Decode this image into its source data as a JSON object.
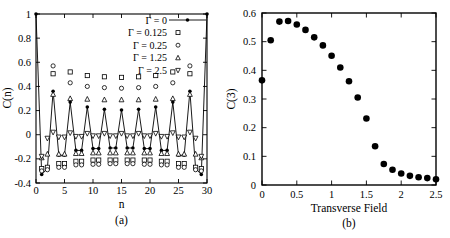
{
  "figure": {
    "background": "#ffffff",
    "ink": "#000000"
  },
  "chart_data": [
    {
      "type": "scatter",
      "panel_label": "(a)",
      "xlabel": "n",
      "ylabel": "C(n)",
      "xlim": [
        0,
        30
      ],
      "ylim": [
        -0.4,
        1
      ],
      "grid": false,
      "xticks": [
        0,
        5,
        10,
        15,
        20,
        25,
        30
      ],
      "xtick_labels": [
        "0",
        "5",
        "10",
        "15",
        "20",
        "25",
        "30"
      ],
      "yticks": [
        -0.4,
        -0.2,
        0,
        0.2,
        0.4,
        0.6,
        0.8,
        1
      ],
      "ytick_labels": [
        "-0.4",
        "-0.2",
        "0",
        "0.2",
        "0.4",
        "0.6",
        "0.8",
        "1"
      ],
      "legend_position": "top-right-inside",
      "series": [
        {
          "name": "Γ = 0",
          "marker": "filled-circle",
          "line": true,
          "x": [
            0,
            1,
            2,
            3,
            4,
            5,
            6,
            7,
            8,
            9,
            10,
            11,
            12,
            13,
            14,
            15,
            16,
            17,
            18,
            19,
            20,
            21,
            22,
            23,
            24,
            25,
            26,
            27,
            28,
            29,
            30
          ],
          "y": [
            1.0,
            -0.33,
            -0.28,
            0.36,
            -0.17,
            -0.17,
            0.27,
            -0.13,
            -0.13,
            0.23,
            -0.115,
            -0.115,
            0.21,
            -0.11,
            -0.11,
            0.205,
            -0.11,
            -0.11,
            0.21,
            -0.115,
            -0.115,
            0.23,
            -0.13,
            -0.13,
            0.27,
            -0.17,
            -0.17,
            0.36,
            -0.28,
            -0.33,
            1.0
          ]
        },
        {
          "name": "Γ = 0.125",
          "marker": "open-square",
          "line": false,
          "x": [
            1,
            2,
            3,
            4,
            5,
            6,
            7,
            8,
            9,
            10,
            11,
            12,
            13,
            14,
            15,
            16,
            17,
            18,
            19,
            20,
            21,
            22,
            23,
            24,
            25,
            26,
            27,
            28,
            29
          ],
          "y": [
            -0.28,
            -0.27,
            0.505,
            -0.24,
            -0.24,
            0.52,
            -0.22,
            -0.22,
            0.49,
            -0.21,
            -0.21,
            0.48,
            -0.21,
            -0.21,
            0.475,
            -0.21,
            -0.21,
            0.48,
            -0.21,
            -0.21,
            0.49,
            -0.22,
            -0.22,
            0.52,
            -0.24,
            -0.24,
            0.505,
            -0.27,
            -0.28
          ]
        },
        {
          "name": "Γ = 0.25",
          "marker": "open-circle",
          "line": false,
          "x": [
            1,
            2,
            3,
            4,
            5,
            6,
            7,
            8,
            9,
            10,
            11,
            12,
            13,
            14,
            15,
            16,
            17,
            18,
            19,
            20,
            21,
            22,
            23,
            24,
            25,
            26,
            27,
            28,
            29
          ],
          "y": [
            -0.3,
            -0.29,
            0.57,
            -0.27,
            -0.27,
            0.43,
            -0.25,
            -0.25,
            0.4,
            -0.245,
            -0.245,
            0.39,
            -0.24,
            -0.24,
            0.385,
            -0.24,
            -0.24,
            0.39,
            -0.245,
            -0.245,
            0.4,
            -0.25,
            -0.25,
            0.43,
            -0.27,
            -0.27,
            0.57,
            -0.29,
            -0.3
          ]
        },
        {
          "name": "Γ = 1.25",
          "marker": "open-triangle-up",
          "line": false,
          "x": [
            1,
            2,
            3,
            4,
            5,
            6,
            7,
            8,
            9,
            10,
            11,
            12,
            13,
            14,
            15,
            16,
            17,
            18,
            19,
            20,
            21,
            22,
            23,
            24,
            25,
            26,
            27,
            28,
            29
          ],
          "y": [
            -0.19,
            -0.16,
            0.335,
            -0.16,
            -0.16,
            0.3,
            -0.155,
            -0.155,
            0.295,
            -0.15,
            -0.15,
            0.29,
            -0.15,
            -0.15,
            0.29,
            -0.15,
            -0.15,
            0.29,
            -0.15,
            -0.15,
            0.295,
            -0.155,
            -0.155,
            0.3,
            -0.16,
            -0.16,
            0.335,
            -0.16,
            -0.19
          ]
        },
        {
          "name": "Γ = 2.5",
          "marker": "open-triangle-down",
          "line": false,
          "x": [
            1,
            2,
            3,
            4,
            5,
            6,
            7,
            8,
            9,
            10,
            11,
            12,
            13,
            14,
            15,
            16,
            17,
            18,
            19,
            20,
            21,
            22,
            23,
            24,
            25,
            26,
            27,
            28,
            29
          ],
          "y": [
            -0.18,
            -0.03,
            0.02,
            -0.02,
            -0.02,
            0.015,
            -0.015,
            -0.015,
            0.01,
            -0.01,
            -0.01,
            0.01,
            -0.01,
            -0.01,
            0.01,
            -0.01,
            -0.01,
            0.01,
            -0.01,
            -0.01,
            0.01,
            -0.015,
            -0.015,
            0.015,
            -0.02,
            -0.02,
            0.02,
            -0.03,
            -0.18
          ]
        }
      ]
    },
    {
      "type": "scatter",
      "panel_label": "(b)",
      "xlabel": "Transverse Field",
      "ylabel": "C(3)",
      "xlim": [
        0,
        2.5
      ],
      "ylim": [
        0,
        0.6
      ],
      "grid": false,
      "xticks": [
        0,
        0.5,
        1,
        1.5,
        2,
        2.5
      ],
      "xtick_labels": [
        "0",
        "0.5",
        "1",
        "1.5",
        "2",
        "2.5"
      ],
      "yticks": [
        0,
        0.1,
        0.2,
        0.3,
        0.4,
        0.5,
        0.6
      ],
      "ytick_labels": [
        "0",
        "0.1",
        "0.2",
        "0.3",
        "0.4",
        "0.5",
        "0.6"
      ],
      "legend_position": "none",
      "series": [
        {
          "name": "C(3)",
          "marker": "filled-circle",
          "line": false,
          "x": [
            0,
            0.125,
            0.25,
            0.375,
            0.5,
            0.625,
            0.75,
            0.875,
            1.0,
            1.125,
            1.25,
            1.375,
            1.5,
            1.625,
            1.75,
            1.875,
            2.0,
            2.125,
            2.25,
            2.375,
            2.5
          ],
          "y": [
            0.365,
            0.505,
            0.57,
            0.572,
            0.56,
            0.541,
            0.515,
            0.487,
            0.451,
            0.41,
            0.362,
            0.305,
            0.232,
            0.135,
            0.073,
            0.053,
            0.04,
            0.032,
            0.027,
            0.024,
            0.02
          ]
        }
      ]
    }
  ]
}
